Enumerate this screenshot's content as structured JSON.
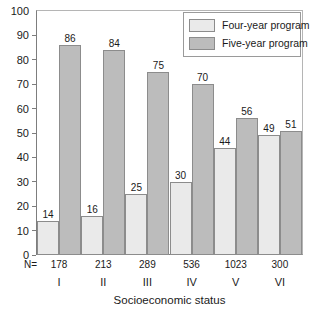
{
  "chart_data": {
    "type": "bar",
    "title": "",
    "xlabel": "Socioeconomic status",
    "ylabel": "",
    "categories": [
      "I",
      "II",
      "III",
      "IV",
      "V",
      "VI"
    ],
    "series": [
      {
        "name": "Four-year program",
        "values": [
          14,
          16,
          25,
          30,
          44,
          49
        ],
        "color": "#eaeaea"
      },
      {
        "name": "Five-year program",
        "values": [
          86,
          84,
          75,
          70,
          56,
          51
        ],
        "color": "#bcbcbc"
      }
    ],
    "group_sizes": [
      "178",
      "213",
      "289",
      "536",
      "1023",
      "300"
    ],
    "group_size_prefix": "N=",
    "ylim": [
      0,
      100
    ],
    "yticks": [
      "0",
      "10",
      "20",
      "30",
      "40",
      "50",
      "60",
      "70",
      "80",
      "90",
      "100"
    ],
    "grid": false,
    "legend_position": "top-right",
    "value_labels": true
  },
  "legend": {
    "items": [
      {
        "label": "Four-year program",
        "swatch": "four"
      },
      {
        "label": "Five-year program",
        "swatch": "five"
      }
    ]
  },
  "axis": {
    "x_title": "Socioeconomic status",
    "n_prefix": "N="
  }
}
